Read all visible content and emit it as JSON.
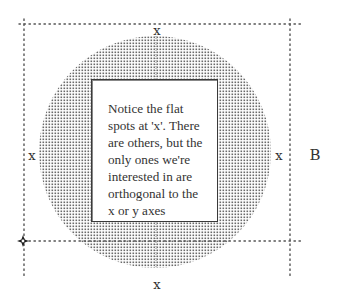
{
  "diagram": {
    "labels": {
      "top_x": "x",
      "left_x": "x",
      "right_x": "x",
      "bottom_x": "x",
      "boundary_label": "B"
    },
    "note": {
      "lines": [
        "Notice the flat",
        "spots at 'x'. There",
        "are others, but the",
        "only ones we're",
        "interested in are",
        "orthogonal to the",
        "x or y axes"
      ]
    },
    "shapes": {
      "circle": {
        "cx": 155,
        "cy": 152,
        "r": 116,
        "fill_pattern": "dot-stipple",
        "dot_color": "#6a6a6a"
      },
      "bounding_box": {
        "left": 24,
        "top": 24,
        "right": 290,
        "bottom": 241,
        "style": "dotted"
      },
      "origin_marker": {
        "x": 24,
        "y": 241,
        "shape": "four-point-star"
      }
    },
    "colors": {
      "background": "#ffffff",
      "stroke": "#3a3a3a",
      "dots": "#555555"
    }
  }
}
